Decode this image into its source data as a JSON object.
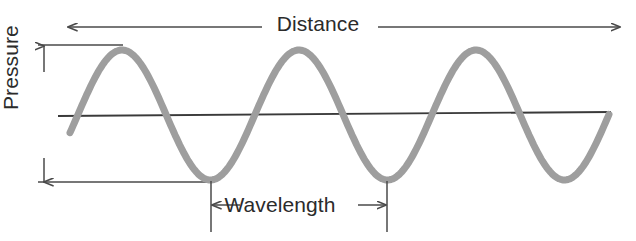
{
  "figure": {
    "background_color": "#ffffff",
    "wave_color": "#9e9e9e",
    "axis_color": "#3a3a3a",
    "annotation_color": "#4a4a4a",
    "text_color": "#2b2b2b"
  },
  "labels": {
    "distance": "Distance",
    "pressure": "Pressure",
    "wavelength": "Wavelength"
  },
  "annotations": {
    "distance_arrow": {
      "name": "double-headed horizontal arrow spanning full width",
      "x_start": 68,
      "x_end": 620,
      "y": 27,
      "heads": "both"
    },
    "pressure_arrow": {
      "name": "double-headed vertical arrow spanning peak to trough",
      "x": 44,
      "y_top": 46,
      "y_bottom": 182,
      "heads": "both"
    },
    "wavelength_arrow": {
      "name": "double-headed horizontal arrow between adjacent troughs",
      "x_start": 211,
      "x_end": 387,
      "y": 205,
      "heads": "both"
    },
    "peak_reference_line": {
      "x_start": 38,
      "x_end": 122,
      "y": 45
    },
    "trough_reference_line": {
      "x_start": 38,
      "x_end": 211,
      "y": 182
    },
    "wavelength_tick_left": {
      "x": 211,
      "y_top": 181,
      "y_bottom": 232
    },
    "wavelength_tick_right": {
      "x": 387,
      "y_top": 181,
      "y_bottom": 232
    }
  },
  "chart_data": {
    "type": "line",
    "title": "",
    "xlabel": "Distance",
    "ylabel": "Pressure",
    "legend": null,
    "grid": false,
    "axis": {
      "baseline_y_pixel": 114,
      "baseline_x_start": 58,
      "baseline_x_end": 611,
      "note": "Horizontal zero-pressure baseline drawn with a very slight downward tilt left-to-right"
    },
    "waveform": {
      "shape": "sinusoid",
      "cycles_shown": 3,
      "wavelength_pixels": 177,
      "amplitude_pixels": 65,
      "peak_y_pixel": 50,
      "trough_y_pixel": 180,
      "center_y_pixel": 115,
      "x_start": 70,
      "x_end": 609,
      "stroke_width": 7,
      "peaks_x": [
        122,
        300,
        477
      ],
      "troughs_x": [
        211,
        387,
        565
      ],
      "zero_crossings_x": [
        78,
        166,
        255,
        343,
        432,
        520,
        609
      ]
    },
    "series": [
      {
        "name": "Pressure",
        "x": [
          70,
          78,
          100,
          122,
          144,
          166,
          188,
          211,
          233,
          255,
          277,
          300,
          322,
          343,
          365,
          387,
          410,
          432,
          454,
          477,
          499,
          520,
          543,
          565,
          587,
          609
        ],
        "y": [
          148,
          115,
          69,
          50,
          69,
          115,
          161,
          180,
          161,
          115,
          69,
          50,
          69,
          115,
          161,
          180,
          161,
          115,
          69,
          50,
          69,
          115,
          161,
          180,
          161,
          62
        ]
      }
    ],
    "ylim": [
      180,
      50
    ],
    "xlim": [
      70,
      609
    ]
  }
}
